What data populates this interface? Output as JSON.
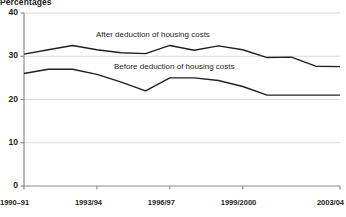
{
  "chart_data": {
    "type": "line",
    "title": "Percentages",
    "xlabel": "",
    "ylabel": "Percentages",
    "ylim": [
      0,
      40
    ],
    "yticks": [
      0,
      10,
      20,
      30,
      40
    ],
    "ytick_labels": [
      "0",
      "10",
      "20",
      "30",
      "40"
    ],
    "grid": true,
    "legend_position": "inline-annotation",
    "x": [
      "1990-91",
      "1991/92",
      "1992/93",
      "1993/94",
      "1994/95",
      "1995/96",
      "1996/97",
      "1997/98",
      "1998/99",
      "1999/2000",
      "2000/01",
      "2001/02",
      "2002/03",
      "2003/04"
    ],
    "xtick_labels": [
      "1990–91",
      "1993/94",
      "1996/97",
      "1999/2000",
      "2003/04"
    ],
    "xtick_positions": [
      0,
      3,
      6,
      9,
      13
    ],
    "series": [
      {
        "name": "After deduction of housing costs",
        "values": [
          30.5,
          31.5,
          32.5,
          31.5,
          30.8,
          30.6,
          32.5,
          31.4,
          32.4,
          31.5,
          29.7,
          29.8,
          27.7,
          27.6
        ],
        "color": "#231f20"
      },
      {
        "name": "Before deduction of housing costs",
        "values": [
          26.0,
          27.0,
          27.0,
          25.8,
          24.0,
          22.0,
          25.0,
          25.0,
          24.4,
          23.0,
          21.0,
          21.0,
          21.0,
          21.0
        ],
        "color": "#231f20"
      }
    ],
    "annotations": [
      {
        "text": "After deduction of housing costs",
        "x_px": 95,
        "y_px": 30
      },
      {
        "text": "Before deduction of housing costs",
        "x_px": 113,
        "y_px": 62
      }
    ]
  },
  "axis": {
    "y_labels": [
      "40",
      "30",
      "20",
      "10",
      "0"
    ],
    "x_labels": [
      "1990–91",
      "1993/94",
      "1996/97",
      "1999/2000",
      "2003/04"
    ]
  }
}
